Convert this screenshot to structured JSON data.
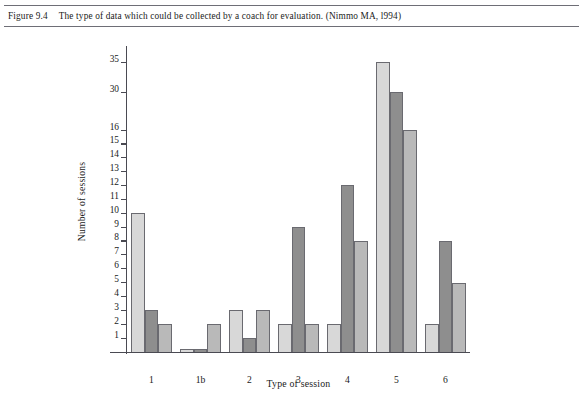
{
  "caption": {
    "figure_number": "Figure 9.4",
    "text": "The type of data which could be collected by a coach for evaluation. (Nimmo MA, l994)"
  },
  "chart_data": {
    "type": "bar",
    "title": "",
    "xlabel": "Type of session",
    "ylabel": "Number of sessions",
    "categories": [
      "1",
      "1b",
      "2",
      "3",
      "4",
      "5",
      "6"
    ],
    "series": [
      {
        "name": "series-1",
        "color": "#d8d8d8",
        "values": [
          10,
          0.25,
          3,
          2,
          2,
          35,
          2
        ]
      },
      {
        "name": "series-2",
        "color": "#8e8e8e",
        "values": [
          3,
          0.25,
          1,
          9,
          12,
          30,
          8
        ]
      },
      {
        "name": "series-3",
        "color": "#b9b9b9",
        "values": [
          2,
          2,
          3,
          2,
          8,
          16,
          5
        ]
      }
    ],
    "ytick_labels": [
      "1",
      "2",
      "3",
      "4",
      "5",
      "6",
      "7",
      "8",
      "9",
      "10",
      "11",
      "12",
      "13",
      "14",
      "15",
      "16",
      "30",
      "35"
    ],
    "ytick_values": [
      1,
      2,
      3,
      4,
      5,
      6,
      7,
      8,
      9,
      10,
      11,
      12,
      13,
      14,
      15,
      16,
      30,
      35
    ],
    "axis_note": "broken y-axis: 1-16 linear, then 30 and 35",
    "ylim": [
      0,
      35
    ],
    "grid": false,
    "legend": "none"
  },
  "colors": {
    "bar_light": "#d8d8d8",
    "bar_dark": "#8e8e8e",
    "bar_medium": "#b9b9b9",
    "axis": "#4a4a52",
    "rule": "#6e6e76",
    "text": "#1a1a1a"
  }
}
